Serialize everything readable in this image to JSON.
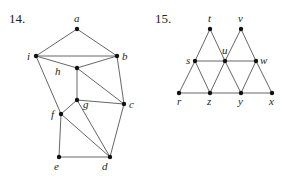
{
  "figures": [
    {
      "number": "14.",
      "nodes": [
        {
          "id": "a",
          "label": "a",
          "x": 77,
          "y": 29
        },
        {
          "id": "i",
          "label": "i",
          "x": 36,
          "y": 56
        },
        {
          "id": "b",
          "label": "b",
          "x": 117,
          "y": 56
        },
        {
          "id": "h",
          "label": "h",
          "x": 77,
          "y": 68
        },
        {
          "id": "g",
          "label": "g",
          "x": 77,
          "y": 100
        },
        {
          "id": "c",
          "label": "c",
          "x": 124,
          "y": 104
        },
        {
          "id": "f",
          "label": "f",
          "x": 61,
          "y": 114
        },
        {
          "id": "e",
          "label": "e",
          "x": 59,
          "y": 157
        },
        {
          "id": "d",
          "label": "d",
          "x": 110,
          "y": 157
        }
      ],
      "edges": [
        [
          "a",
          "i"
        ],
        [
          "a",
          "b"
        ],
        [
          "i",
          "b"
        ],
        [
          "i",
          "h"
        ],
        [
          "h",
          "b"
        ],
        [
          "i",
          "f"
        ],
        [
          "h",
          "g"
        ],
        [
          "h",
          "c"
        ],
        [
          "b",
          "c"
        ],
        [
          "g",
          "c"
        ],
        [
          "g",
          "f"
        ],
        [
          "g",
          "d"
        ],
        [
          "f",
          "d"
        ],
        [
          "f",
          "e"
        ],
        [
          "e",
          "d"
        ],
        [
          "c",
          "d"
        ]
      ]
    },
    {
      "number": "15.",
      "nodes": [
        {
          "id": "t",
          "label": "t",
          "x": 210,
          "y": 29
        },
        {
          "id": "v",
          "label": "v",
          "x": 241,
          "y": 29
        },
        {
          "id": "s",
          "label": "s",
          "x": 195,
          "y": 61
        },
        {
          "id": "u",
          "label": "u",
          "x": 225,
          "y": 61
        },
        {
          "id": "w",
          "label": "w",
          "x": 256,
          "y": 61
        },
        {
          "id": "r",
          "label": "r",
          "x": 179,
          "y": 93
        },
        {
          "id": "z",
          "label": "z",
          "x": 210,
          "y": 93
        },
        {
          "id": "y",
          "label": "y",
          "x": 241,
          "y": 93
        },
        {
          "id": "x",
          "label": "x",
          "x": 272,
          "y": 93
        }
      ],
      "edges": [
        [
          "t",
          "s"
        ],
        [
          "t",
          "u"
        ],
        [
          "v",
          "u"
        ],
        [
          "v",
          "w"
        ],
        [
          "s",
          "u"
        ],
        [
          "u",
          "w"
        ],
        [
          "s",
          "r"
        ],
        [
          "s",
          "z"
        ],
        [
          "u",
          "z"
        ],
        [
          "u",
          "y"
        ],
        [
          "w",
          "y"
        ],
        [
          "w",
          "x"
        ],
        [
          "r",
          "z"
        ],
        [
          "z",
          "y"
        ],
        [
          "y",
          "x"
        ]
      ]
    }
  ]
}
